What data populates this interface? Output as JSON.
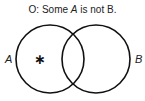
{
  "title": {
    "prefix": "O:  Some ",
    "term_a": "A",
    "suffix": " is not B."
  },
  "circles": [
    {
      "label": "A",
      "cx": 50,
      "cy": 59,
      "r": 34
    },
    {
      "label": "B",
      "cx": 96,
      "cy": 59,
      "r": 34
    }
  ],
  "marker": {
    "symbol": "∗",
    "region": "A only"
  },
  "colors": {
    "stroke": "#111111",
    "text": "#222222"
  }
}
